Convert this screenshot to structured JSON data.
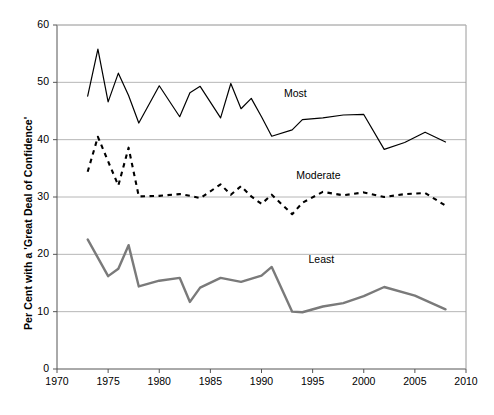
{
  "chart_data": {
    "type": "line",
    "title": "",
    "xlabel": "",
    "ylabel": "Per Cent with a 'Great Deal of Confidence'",
    "xlim": [
      1970,
      2010
    ],
    "ylim": [
      0,
      60
    ],
    "xticks": [
      1970,
      1975,
      1980,
      1985,
      1990,
      1995,
      2000,
      2005,
      2010
    ],
    "yticks": [
      0,
      10,
      20,
      30,
      40,
      50,
      60
    ],
    "grid": "horizontal",
    "legend_position": "inline-annotation",
    "series": [
      {
        "name": "Most",
        "style": "solid-thin-black",
        "color": "#000000",
        "label_x": 1992.2,
        "label_y": 48.0,
        "x": [
          1973,
          1974,
          1975,
          1976,
          1977,
          1978,
          1980,
          1982,
          1983,
          1984,
          1986,
          1987,
          1988,
          1989,
          1990,
          1991,
          1993,
          1994,
          1996,
          1998,
          2000,
          2002,
          2004,
          2006,
          2008
        ],
        "y": [
          47.6,
          55.8,
          46.6,
          51.6,
          47.7,
          42.9,
          49.4,
          44.0,
          48.2,
          49.3,
          43.8,
          49.8,
          45.4,
          47.2,
          44.0,
          40.6,
          41.7,
          43.5,
          43.8,
          44.3,
          44.4,
          38.3,
          39.5,
          41.3,
          39.6
        ]
      },
      {
        "name": "Moderate",
        "style": "dashed-black",
        "color": "#000000",
        "label_x": 1993.4,
        "label_y": 33.6,
        "x": [
          1973,
          1974,
          1975,
          1976,
          1977,
          1978,
          1980,
          1982,
          1983,
          1984,
          1986,
          1987,
          1988,
          1989,
          1990,
          1991,
          1993,
          1994,
          1996,
          1998,
          2000,
          2002,
          2004,
          2006,
          2008
        ],
        "y": [
          34.4,
          40.5,
          36.2,
          32.0,
          38.6,
          30.1,
          30.2,
          30.5,
          30.2,
          29.8,
          32.2,
          30.4,
          31.9,
          30.1,
          28.8,
          30.4,
          27.0,
          29.0,
          30.9,
          30.3,
          30.8,
          30.0,
          30.5,
          30.7,
          28.5
        ]
      },
      {
        "name": "Least",
        "style": "solid-thick-gray",
        "color": "#7a7a7a",
        "label_x": 1994.6,
        "label_y": 19.0,
        "x": [
          1973,
          1975,
          1976,
          1977,
          1978,
          1980,
          1982,
          1983,
          1984,
          1986,
          1988,
          1990,
          1991,
          1993,
          1994,
          1996,
          1998,
          2000,
          2002,
          2005,
          2008
        ],
        "y": [
          22.6,
          16.2,
          17.5,
          21.6,
          14.4,
          15.4,
          15.9,
          11.7,
          14.2,
          15.9,
          15.2,
          16.3,
          17.8,
          10.0,
          9.9,
          10.9,
          11.5,
          12.7,
          14.3,
          12.8,
          10.4
        ]
      }
    ]
  },
  "plot_geometry": {
    "left": 57,
    "right": 466,
    "top": 25,
    "bottom": 369
  },
  "axis_ticks": {
    "y": [
      "60",
      "50",
      "40",
      "30",
      "20",
      "10",
      "0"
    ],
    "x": [
      "1970",
      "1975",
      "1980",
      "1985",
      "1990",
      "1995",
      "2000",
      "2005",
      "2010"
    ]
  }
}
